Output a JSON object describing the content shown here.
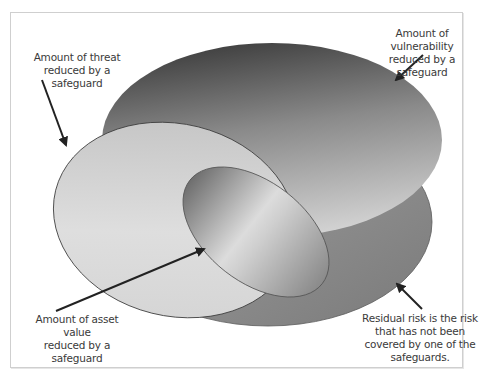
{
  "diagram": {
    "type": "nested-ellipse risk diagram",
    "colors": {
      "frame_border": "#cfcfcf",
      "residual_risk_fill": "#8e8e8e",
      "vulnerability_fill_dark": "#4a4a4a",
      "vulnerability_fill_light": "#bdbdbd",
      "threat_fill": "#d8d8d8",
      "asset_fill": "#b5b5b5",
      "arrow": "#222222",
      "text": "#3a3a3a"
    },
    "labels": {
      "threat": {
        "line1": "Amount of threat",
        "line2": "reduced by a safeguard"
      },
      "vulnerability": {
        "line1": "Amount of vulnerability",
        "line2": "reduced by a safeguard"
      },
      "asset": {
        "line1": "Amount of asset value",
        "line2": "reduced by a safeguard"
      },
      "residual": {
        "line1": "Residual risk is the risk",
        "line2": "that has not been",
        "line3": "covered by one of the",
        "line4": "safeguards."
      }
    }
  }
}
